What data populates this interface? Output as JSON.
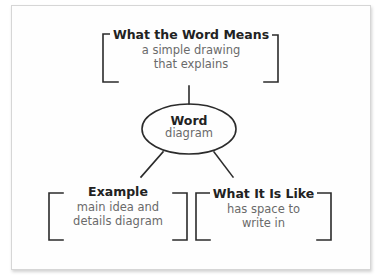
{
  "diagram": {
    "top_box": {
      "title": "What the Word Means",
      "line1": "a simple drawing",
      "line2": "that explains"
    },
    "center_node": {
      "title": "Word",
      "subtitle": "diagram"
    },
    "bottom_left_box": {
      "title": "Example",
      "line1": "main idea and",
      "line2": "details diagram"
    },
    "bottom_right_box": {
      "title": "What It Is Like",
      "line1": "has space to",
      "line2": "write in"
    }
  },
  "colors": {
    "stroke": "#2b2b2b",
    "title_text": "#222222",
    "body_text": "#6a6a6a",
    "card_border": "#d6d6d6"
  }
}
